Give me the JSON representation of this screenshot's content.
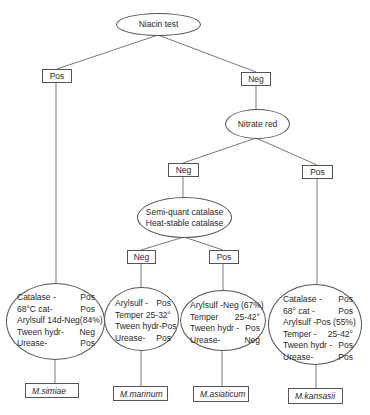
{
  "root": {
    "label": "Niacin test"
  },
  "niacin_pos": {
    "label": "Pos"
  },
  "niacin_neg": {
    "label": "Neg"
  },
  "nitrate": {
    "label": "Nitrate red"
  },
  "nitrate_neg": {
    "label": "Neg"
  },
  "nitrate_pos": {
    "label": "Pos"
  },
  "catalase": {
    "line1": "Semi-quant catalase",
    "line2": "Heat-stable catalase"
  },
  "catalase_neg": {
    "label": "Neg"
  },
  "catalase_pos": {
    "label": "Pos"
  },
  "results": [
    {
      "species": "M.simiae",
      "rows": [
        {
          "k": "Catalase -",
          "v": "Pos"
        },
        {
          "k": "68°C cat-",
          "v": "Pos"
        },
        {
          "k": "Arylsulf 14d-Neg",
          "v": "(84%)"
        },
        {
          "k": "Tween hydr-",
          "v": "Neg"
        },
        {
          "k": "Urease-",
          "v": "Pos"
        }
      ]
    },
    {
      "species": "M.marinum",
      "rows": [
        {
          "k": "Arylsulf -",
          "v": "Pos"
        },
        {
          "k": "Temper",
          "v": "25-32°"
        },
        {
          "k": "Tween hydr-",
          "v": "Pos"
        },
        {
          "k": "Urease-",
          "v": "Pos"
        }
      ]
    },
    {
      "species": "M.asiaticum",
      "rows": [
        {
          "k": "Arylsulf -",
          "v": "Neg (67%)"
        },
        {
          "k": "Temper",
          "v": "25-42°"
        },
        {
          "k": "Tween hydr -",
          "v": "Pos"
        },
        {
          "k": "Urease-",
          "v": "Neg"
        }
      ]
    },
    {
      "species": "M.kansasii",
      "rows": [
        {
          "k": "Catalase -",
          "v": "Pos"
        },
        {
          "k": "68° cat -",
          "v": "Pos"
        },
        {
          "k": "Arylsulf -",
          "v": "Pos (55%)"
        },
        {
          "k": "Temper -",
          "v": "25-42°"
        },
        {
          "k": "Tween hydr -",
          "v": "Pos"
        },
        {
          "k": "Urease-",
          "v": "Pos"
        }
      ]
    }
  ]
}
